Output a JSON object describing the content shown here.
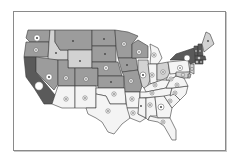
{
  "map": {
    "title": "",
    "type": "choropleth with proportional symbols",
    "legend": [],
    "shades": {
      "darkest": "#5a5a5a",
      "dark": "#7d7d7d",
      "medium": "#9c9c9c",
      "light": "#d2d2d2",
      "lightest": "#f4f4f4"
    },
    "states": [
      {
        "id": "WA",
        "shade": "medium",
        "marker": "medium"
      },
      {
        "id": "OR",
        "shade": "medium",
        "marker": "small"
      },
      {
        "id": "CA",
        "shade": "darkest",
        "marker": "large"
      },
      {
        "id": "ID",
        "shade": "light",
        "marker": "dot"
      },
      {
        "id": "NV",
        "shade": "medium",
        "marker": "medium"
      },
      {
        "id": "MT",
        "shade": "medium",
        "marker": "dot"
      },
      {
        "id": "WY",
        "shade": "light",
        "marker": "dot"
      },
      {
        "id": "UT",
        "shade": "medium",
        "marker": "small"
      },
      {
        "id": "CO",
        "shade": "medium",
        "marker": "small"
      },
      {
        "id": "AZ",
        "shade": "lightest",
        "marker": "small"
      },
      {
        "id": "NM",
        "shade": "lightest",
        "marker": "small"
      },
      {
        "id": "ND",
        "shade": "medium",
        "marker": "dot"
      },
      {
        "id": "SD",
        "shade": "medium",
        "marker": "dot"
      },
      {
        "id": "NE",
        "shade": "medium",
        "marker": "small"
      },
      {
        "id": "KS",
        "shade": "medium",
        "marker": "dot"
      },
      {
        "id": "OK",
        "shade": "lightest",
        "marker": "small"
      },
      {
        "id": "TX",
        "shade": "lightest",
        "marker": "small"
      },
      {
        "id": "MN",
        "shade": "medium",
        "marker": "small"
      },
      {
        "id": "IA",
        "shade": "medium",
        "marker": "dot"
      },
      {
        "id": "MO",
        "shade": "medium",
        "marker": "small"
      },
      {
        "id": "AR",
        "shade": "lightest",
        "marker": "small"
      },
      {
        "id": "LA",
        "shade": "lightest",
        "marker": "small"
      },
      {
        "id": "WI",
        "shade": "medium",
        "marker": "small"
      },
      {
        "id": "IL",
        "shade": "light",
        "marker": "medium"
      },
      {
        "id": "MI",
        "shade": "lightest",
        "marker": "small"
      },
      {
        "id": "IN",
        "shade": "lightest",
        "marker": "small"
      },
      {
        "id": "OH",
        "shade": "light",
        "marker": "small"
      },
      {
        "id": "KY",
        "shade": "lightest",
        "marker": "small"
      },
      {
        "id": "TN",
        "shade": "lightest",
        "marker": "small"
      },
      {
        "id": "MS",
        "shade": "lightest",
        "marker": "dot"
      },
      {
        "id": "AL",
        "shade": "lightest",
        "marker": "small"
      },
      {
        "id": "GA",
        "shade": "lightest",
        "marker": "medium"
      },
      {
        "id": "FL",
        "shade": "lightest",
        "marker": "small"
      },
      {
        "id": "SC",
        "shade": "lightest",
        "marker": "small"
      },
      {
        "id": "NC",
        "shade": "lightest",
        "marker": "small"
      },
      {
        "id": "VA",
        "shade": "lightest",
        "marker": "small"
      },
      {
        "id": "WV",
        "shade": "lightest",
        "marker": "small"
      },
      {
        "id": "PA",
        "shade": "lightest",
        "marker": "small"
      },
      {
        "id": "NY",
        "shade": "darkest",
        "marker": "medium"
      },
      {
        "id": "VT",
        "shade": "darkest",
        "marker": "dot"
      },
      {
        "id": "NH",
        "shade": "darkest",
        "marker": "dot"
      },
      {
        "id": "ME",
        "shade": "light",
        "marker": "dot"
      },
      {
        "id": "MA",
        "shade": "darkest",
        "marker": "small"
      },
      {
        "id": "CT",
        "shade": "darkest",
        "marker": "small"
      },
      {
        "id": "RI",
        "shade": "darkest",
        "marker": "dot"
      },
      {
        "id": "NJ",
        "shade": "light",
        "marker": "small"
      },
      {
        "id": "DE",
        "shade": "light",
        "marker": "dot"
      },
      {
        "id": "MD",
        "shade": "light",
        "marker": "small"
      }
    ]
  }
}
